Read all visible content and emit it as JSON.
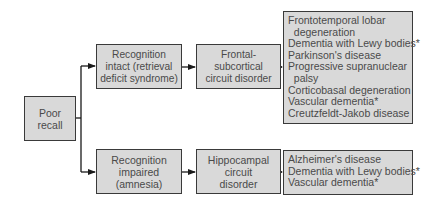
{
  "diagram": {
    "type": "flowchart",
    "root": {
      "label": "Poor\nrecall"
    },
    "branch_top": {
      "category": {
        "label": "Recognition\nintact (retrieval\ndeficit syndrome)"
      },
      "disorder": {
        "label": "Frontal-\nsubcortical\ncircuit disorder"
      },
      "diseases": [
        "Frontotemporal lobar",
        "  degeneration",
        "Dementia with Lewy bodies*",
        "Parkinson's disease",
        "Progressive supranuclear",
        "  palsy",
        "Corticobasal degeneration",
        "Vascular dementia*",
        "Creutzfeldt-Jakob disease"
      ]
    },
    "branch_bottom": {
      "category": {
        "label": "Recognition\nimpaired\n(amnesia)"
      },
      "disorder": {
        "label": "Hippocampal\ncircuit\ndisorder"
      },
      "diseases": [
        "Alzheimer's disease",
        "Dementia with Lewy bodies*",
        "Vascular dementia*"
      ]
    },
    "colors": {
      "box_fill": "#d9d9d9",
      "box_border": "#3a3a3a",
      "text": "#4a4a4a",
      "connector": "#1a1a1a"
    }
  }
}
